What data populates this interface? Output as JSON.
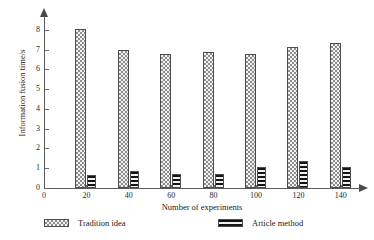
{
  "chart_data": {
    "type": "bar",
    "title": "",
    "subtitle": "",
    "xlabel": "Number of experiments",
    "ylabel": "Information fusion time/s",
    "categories": [
      20,
      40,
      60,
      80,
      100,
      120,
      140
    ],
    "xticks": [
      0,
      20,
      40,
      60,
      80,
      100,
      120,
      140
    ],
    "yticks": [
      0,
      1,
      2,
      3,
      4,
      5,
      6,
      7,
      8
    ],
    "xlim": [
      0,
      150
    ],
    "ylim": [
      0,
      8.6
    ],
    "grid": false,
    "legend_position": "bottom",
    "series": [
      {
        "name": "Tradition idea",
        "pattern": "checkerboard",
        "values": [
          8.02,
          6.98,
          6.8,
          6.87,
          6.8,
          7.15,
          7.36
        ]
      },
      {
        "name": "Article method",
        "pattern": "horizontal-stripes",
        "values": [
          0.67,
          0.88,
          0.7,
          0.72,
          1.05,
          1.37,
          1.05
        ]
      }
    ]
  },
  "axes": {
    "x_title": "Number of experiments",
    "y_title": "Information fusion time/s",
    "x_tick_labels": [
      "0",
      "20",
      "40",
      "60",
      "80",
      "100",
      "120",
      "140"
    ],
    "y_tick_labels": [
      "0",
      "1",
      "2",
      "3",
      "4",
      "5",
      "6",
      "7",
      "8"
    ]
  },
  "legend": {
    "items": [
      {
        "label": "Tradition idea"
      },
      {
        "label": "Article method"
      }
    ]
  },
  "colors": {
    "axis": "#5a5a5a",
    "tradition_fill": "#8d8d8d",
    "article_fill": "#141414",
    "text": "#1a1a1a",
    "background": "#ffffff"
  }
}
